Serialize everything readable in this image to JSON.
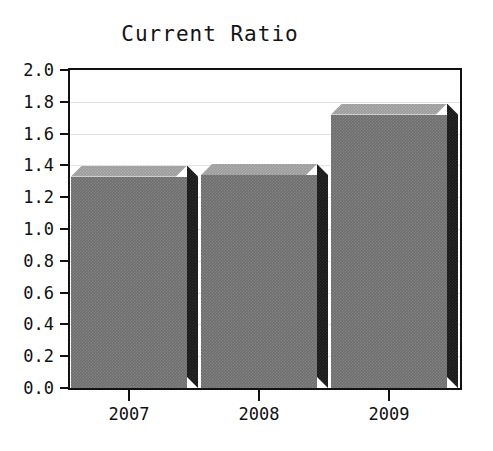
{
  "chart_data": {
    "type": "bar",
    "title": "Current Ratio",
    "xlabel": "",
    "ylabel": "",
    "categories": [
      "2007",
      "2008",
      "2009"
    ],
    "values": [
      1.33,
      1.34,
      1.72
    ],
    "ylim": [
      0.0,
      2.0
    ],
    "ytick_labels": [
      "0.0",
      "0.2",
      "0.4",
      "0.6",
      "0.8",
      "1.0",
      "1.2",
      "1.4",
      "1.6",
      "1.8",
      "2.0"
    ],
    "ytick_values": [
      0.0,
      0.2,
      0.4,
      0.6,
      0.8,
      1.0,
      1.2,
      1.4,
      1.6,
      1.8,
      2.0
    ],
    "grid": true,
    "grid_axis": "y",
    "legend": false,
    "style": "3d-bar",
    "colors": {
      "bar_front": "#6e6e6e",
      "bar_top": "#9c9c9c",
      "bar_side": "#191919",
      "frame": "#111111",
      "gridline": "#e3e3e3",
      "background": "#ffffff",
      "text": "#101010"
    }
  }
}
